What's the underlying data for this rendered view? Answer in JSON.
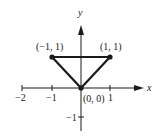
{
  "diagram": {
    "type": "coordinate-plane-triangle",
    "axes": {
      "x_label": "x",
      "y_label": "y"
    },
    "x_ticks": [
      {
        "value": -2,
        "label": "−2"
      },
      {
        "value": -1,
        "label": "−1"
      },
      {
        "value": 1,
        "label": "1"
      }
    ],
    "y_ticks": [
      {
        "value": -1,
        "label": "−1"
      }
    ],
    "points": [
      {
        "x": -1,
        "y": 1,
        "label": "(−1, 1)"
      },
      {
        "x": 1,
        "y": 1,
        "label": "(1, 1)"
      },
      {
        "x": 0,
        "y": 0,
        "label": "(0, 0)"
      }
    ],
    "colors": {
      "stroke": "#1a1a1a",
      "background": "#ffffff"
    }
  }
}
